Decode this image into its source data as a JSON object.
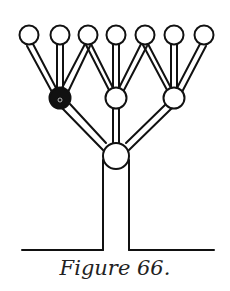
{
  "caption": "Figure 66.",
  "colors": {
    "stroke": "#111111",
    "background": "#ffffff",
    "filled_node": "#111111"
  },
  "diagram": {
    "type": "branching tree",
    "top_nodes": [
      {
        "x": 29,
        "y": 35
      },
      {
        "x": 60,
        "y": 35
      },
      {
        "x": 88,
        "y": 35
      },
      {
        "x": 116,
        "y": 35
      },
      {
        "x": 145,
        "y": 35
      },
      {
        "x": 174,
        "y": 35
      },
      {
        "x": 204,
        "y": 35
      }
    ],
    "middle_nodes": [
      {
        "x": 60,
        "y": 98,
        "filled": true
      },
      {
        "x": 116,
        "y": 98,
        "filled": false
      },
      {
        "x": 174,
        "y": 98,
        "filled": false
      }
    ],
    "root_node": {
      "x": 116,
      "y": 156
    },
    "ground_y": 250
  }
}
